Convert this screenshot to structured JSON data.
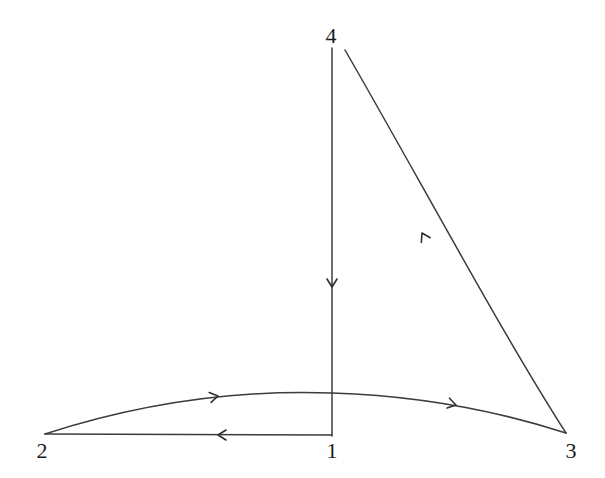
{
  "figure": {
    "type": "directed-graph",
    "background_color": "#ffffff",
    "stroke_color": "#3c3c3c",
    "label_color": "#1a1a1a",
    "width": 605,
    "height": 478
  },
  "nodes": [
    {
      "id": "1",
      "label": "1",
      "label_x": 332,
      "label_y": 451,
      "point_x": 332,
      "point_y": 436
    },
    {
      "id": "2",
      "label": "2",
      "label_x": 42,
      "label_y": 451,
      "point_x": 45,
      "point_y": 434
    },
    {
      "id": "3",
      "label": "3",
      "label_x": 571,
      "label_y": 451,
      "point_x": 566,
      "point_y": 433
    },
    {
      "id": "4",
      "label": "4",
      "label_x": 331,
      "label_y": 36,
      "point_x": 332,
      "point_y": 48
    }
  ],
  "edges": [
    {
      "id": "edge-4-1",
      "from": "4",
      "to": "1",
      "shape": "straight",
      "direction": "down",
      "path": "M 332 48 L 332 436",
      "arrow_x": 332,
      "arrow_y": 287,
      "arrow_angle": 90
    },
    {
      "id": "edge-1-2",
      "from": "1",
      "to": "2",
      "shape": "straight",
      "direction": "left",
      "path": "M 332 435 L 45 434",
      "arrow_x": 218,
      "arrow_y": 435,
      "arrow_angle": 180
    },
    {
      "id": "edge-2-3",
      "from": "2",
      "to": "3",
      "shape": "arc-upward",
      "direction": "right",
      "path": "M 45 434 C 150 400 250 390 332 393 C 430 396 510 415 566 433",
      "arrow_x": 218,
      "arrow_y": 396,
      "arrow_angle": 349,
      "arrow2_x": 456,
      "arrow2_y": 405,
      "arrow2_angle": 14
    },
    {
      "id": "edge-3-4",
      "from": "3",
      "to": "4",
      "shape": "curve-concave",
      "direction": "up-left",
      "path": "M 566 433 C 500 330 420 180 345 50",
      "arrow_x": 422,
      "arrow_y": 233,
      "arrow_angle": 242
    }
  ],
  "legend": {
    "caption": ""
  }
}
